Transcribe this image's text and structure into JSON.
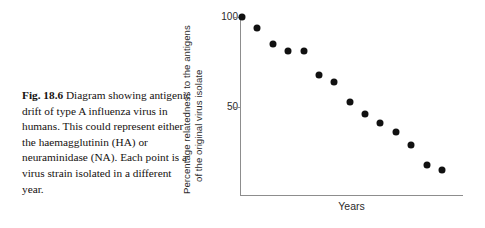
{
  "caption": {
    "figure_label": "Fig. 18.6",
    "text": "Diagram showing antigenic drift of type A influenza virus in humans. This could represent either the haemagglutinin (HA) or neuraminidase (NA). Each point is a virus strain isolated in a different year."
  },
  "chart_data": {
    "type": "scatter",
    "title": "",
    "xlabel": "Years",
    "ylabel_line1": "Percentage relatedness to the antigens",
    "ylabel_line2": "of the original virus isolate",
    "ytick_labels": [
      "100",
      "50"
    ],
    "ytick_values": [
      100,
      50
    ],
    "ylim": [
      0,
      105
    ],
    "xlim": [
      0,
      14
    ],
    "grid": false,
    "legend": null,
    "x": [
      0,
      1,
      2,
      3,
      4,
      5,
      6,
      7,
      8,
      9,
      10,
      11,
      12,
      13
    ],
    "values": [
      100,
      94,
      85,
      81,
      81,
      68,
      64,
      53,
      46,
      41,
      36,
      29,
      18,
      15
    ],
    "points": [
      {
        "x": 0,
        "y": 100
      },
      {
        "x": 1,
        "y": 94
      },
      {
        "x": 2,
        "y": 85
      },
      {
        "x": 3,
        "y": 81
      },
      {
        "x": 4,
        "y": 81
      },
      {
        "x": 5,
        "y": 68
      },
      {
        "x": 6,
        "y": 64
      },
      {
        "x": 7,
        "y": 53
      },
      {
        "x": 8,
        "y": 46
      },
      {
        "x": 9,
        "y": 41
      },
      {
        "x": 10,
        "y": 36
      },
      {
        "x": 11,
        "y": 29
      },
      {
        "x": 12,
        "y": 18
      },
      {
        "x": 13,
        "y": 15
      }
    ]
  },
  "colors": {
    "point": "#111111",
    "axis": "#8d8d8d",
    "text": "#2b2b2b",
    "caption_text": "#15110f",
    "background": "#ffffff"
  }
}
